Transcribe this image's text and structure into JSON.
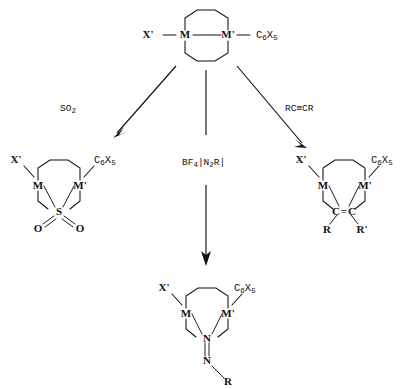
{
  "diagram": {
    "type": "chemical-reaction-scheme",
    "line_color": "#111111",
    "background": "#ffffff"
  },
  "reactant": {
    "name": "starting-bimetallic-complex",
    "left_ligand": "X'",
    "metal_1": "M",
    "metal_2": "M'",
    "right_ligand_base": "C",
    "right_ligand_sub1": "6",
    "right_ligand_elem": "X",
    "right_ligand_sub2": "5",
    "right_ligand_full": "C6X5",
    "left_bond_dash": "—",
    "metal_metal_bond": "—",
    "right_bond_dash": "—"
  },
  "reagents": {
    "left": {
      "label_base": "SO",
      "label_sub": "2",
      "label_full": "SO2"
    },
    "center": {
      "label_base": "BF",
      "label_sub": "4",
      "label_bracket_open": "|N",
      "label_mid_sub": "2",
      "label_tail": "R|",
      "label_full": "BF4 |N2R|"
    },
    "right": {
      "label_full": "RC≡CR"
    }
  },
  "products": {
    "so2_adduct": {
      "name": "sulfur-dioxide-insertion-product",
      "left_ligand": "X'",
      "metal_1": "M",
      "metal_2": "M'",
      "bridge_atom": "S",
      "oxygen_left": "O",
      "oxygen_right": "O",
      "right_ligand_base": "C",
      "right_ligand_sub1": "6",
      "right_ligand_elem": "X",
      "right_ligand_sub2": "5"
    },
    "alkyne_adduct": {
      "name": "alkyne-insertion-product",
      "left_ligand": "X'",
      "metal_1": "M",
      "metal_2": "M'",
      "bridge_carbon_1": "C",
      "bridge_bond": "=",
      "bridge_carbon_2": "C",
      "substituent_left": "R",
      "substituent_right": "R'",
      "right_ligand_base": "C",
      "right_ligand_sub1": "6",
      "right_ligand_elem": "X",
      "right_ligand_sub2": "5"
    },
    "diazo_adduct": {
      "name": "diazonium-insertion-product",
      "left_ligand": "X'",
      "metal_1": "M",
      "metal_2": "M'",
      "bridge_nitrogen": "N",
      "imine_nitrogen": "N",
      "imine_substituent": "R",
      "right_ligand_base": "C",
      "right_ligand_sub1": "6",
      "right_ligand_elem": "X",
      "right_ligand_sub2": "5"
    }
  }
}
